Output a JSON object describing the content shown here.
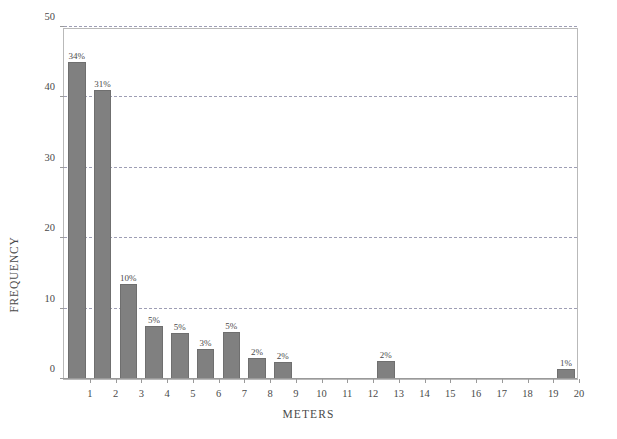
{
  "chart_data": {
    "type": "bar",
    "title": "",
    "xlabel": "METERS",
    "ylabel": "FREQUENCY",
    "ylim": [
      0,
      50
    ],
    "xlim": [
      0,
      20
    ],
    "yticks": [
      0,
      10,
      20,
      30,
      40,
      50
    ],
    "ytick_labels": [
      "0",
      "10",
      "20",
      "30",
      "40",
      "50"
    ],
    "xticks": [
      1,
      2,
      3,
      4,
      5,
      6,
      7,
      8,
      9,
      10,
      11,
      12,
      13,
      14,
      15,
      16,
      17,
      18,
      19,
      20
    ],
    "xtick_labels": [
      "1",
      "2",
      "3",
      "4",
      "5",
      "6",
      "7",
      "8",
      "9",
      "10",
      "11",
      "12",
      "13",
      "14",
      "15",
      "16",
      "17",
      "18",
      "19",
      "20"
    ],
    "grid": "horizontal-dashed",
    "legend": "none",
    "bar_color": "#808080",
    "bar_edge_color": "#6f6f6f",
    "categories": [
      "0-1",
      "1-2",
      "2-3",
      "3-4",
      "4-5",
      "5-6",
      "6-7",
      "7-8",
      "8-9",
      "12-13",
      "19-20"
    ],
    "values": [
      45,
      41,
      13.5,
      7.5,
      6.5,
      4.3,
      6.7,
      3.0,
      2.4,
      2.5,
      1.4
    ],
    "data_labels": [
      "34%",
      "31%",
      "10%",
      "5%",
      "5%",
      "3%",
      "5%",
      "2%",
      "2%",
      "2%",
      "1%"
    ],
    "bars": [
      {
        "bin_start": 0,
        "bin_end": 1,
        "value": 45,
        "label": "34%"
      },
      {
        "bin_start": 1,
        "bin_end": 2,
        "value": 41,
        "label": "31%"
      },
      {
        "bin_start": 2,
        "bin_end": 3,
        "value": 13.5,
        "label": "10%"
      },
      {
        "bin_start": 3,
        "bin_end": 4,
        "value": 7.5,
        "label": "5%"
      },
      {
        "bin_start": 4,
        "bin_end": 5,
        "value": 6.5,
        "label": "5%"
      },
      {
        "bin_start": 5,
        "bin_end": 6,
        "value": 4.3,
        "label": "3%"
      },
      {
        "bin_start": 6,
        "bin_end": 7,
        "value": 6.7,
        "label": "5%"
      },
      {
        "bin_start": 7,
        "bin_end": 8,
        "value": 3.0,
        "label": "2%"
      },
      {
        "bin_start": 8,
        "bin_end": 9,
        "value": 2.4,
        "label": "2%"
      },
      {
        "bin_start": 12,
        "bin_end": 13,
        "value": 2.5,
        "label": "2%"
      },
      {
        "bin_start": 19,
        "bin_end": 20,
        "value": 1.4,
        "label": "1%"
      }
    ]
  }
}
